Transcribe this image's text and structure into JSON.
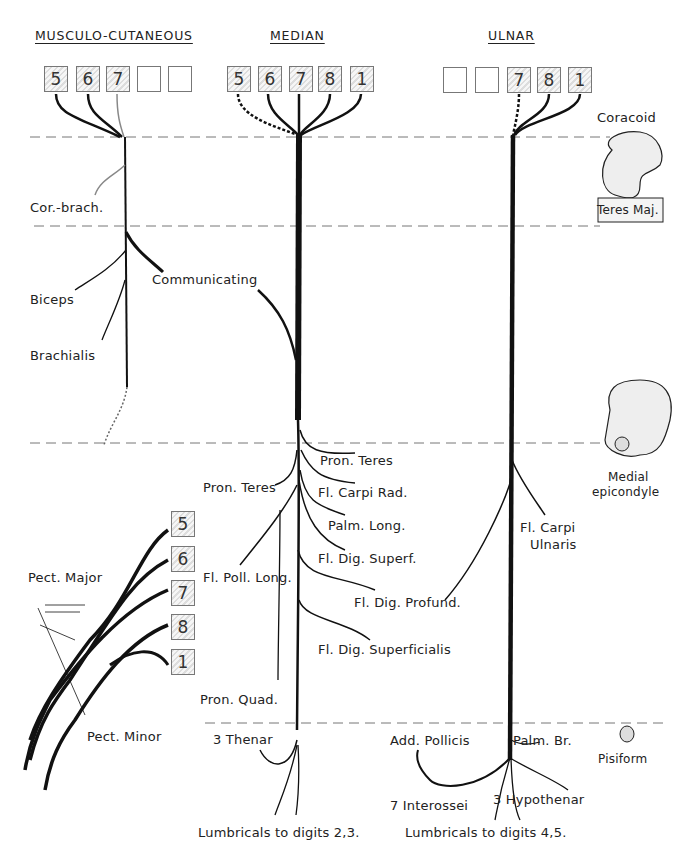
{
  "headers": {
    "musculocutaneous": "MUSCULO-CUTANEOUS",
    "median": "MEDIAN",
    "ulnar": "ULNAR"
  },
  "root_boxes": {
    "musculocutaneous": [
      "5",
      "6",
      "7",
      "",
      ""
    ],
    "median": [
      "5",
      "6",
      "7",
      "8",
      "1"
    ],
    "ulnar": [
      "",
      "",
      "7",
      "8",
      "1"
    ],
    "plexus": [
      "5",
      "6",
      "7",
      "8",
      "1"
    ]
  },
  "landmarks": {
    "coracoid": "Coracoid",
    "teres_major": "Teres Maj.",
    "medial_epicondyle_1": "Medial",
    "medial_epicondyle_2": "epicondyle",
    "pisiform": "Pisiform"
  },
  "musculocutaneous_branches": {
    "cor_brach": "Cor.-brach.",
    "communicating": "Communicating",
    "biceps": "Biceps",
    "brachialis": "Brachialis"
  },
  "median_branches": {
    "pron_teres_right": "Pron. Teres",
    "pron_teres_left": "Pron. Teres",
    "fl_carpi_rad": "Fl. Carpi Rad.",
    "palm_long": "Palm. Long.",
    "fl_dig_superf": "Fl. Dig. Superf.",
    "fl_poll_long": "Fl. Poll. Long.",
    "fl_dig_superficialis": "Fl. Dig. Superficialis",
    "pron_quad": "Pron. Quad.",
    "thenar": "3 Thenar",
    "lumbricals_23": "Lumbricals to digits 2,3."
  },
  "ulnar_branches": {
    "fl_carpi_ulnaris_1": "Fl. Carpi",
    "fl_carpi_ulnaris_2": "Ulnaris",
    "fl_dig_profund": "Fl. Dig. Profund.",
    "add_pollicis": "Add. Pollicis",
    "palm_br": "Palm. Br.",
    "interossei": "7 Interossei",
    "hypothenar": "3 Hypothenar",
    "lumbricals_45": "Lumbricals to digits 4,5."
  },
  "pectoral": {
    "pect_major": "Pect. Major",
    "pect_minor": "Pect. Minor"
  }
}
